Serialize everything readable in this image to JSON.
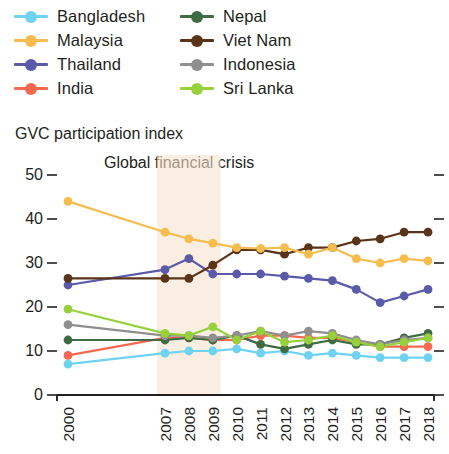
{
  "legend": {
    "columns": [
      [
        {
          "label": "Bangladesh",
          "color": "#6ed3f0",
          "name": "legend-item-bangladesh"
        },
        {
          "label": "Malaysia",
          "color": "#f5bd4e",
          "name": "legend-item-malaysia"
        },
        {
          "label": "Thailand",
          "color": "#5b5aa8",
          "name": "legend-item-thailand"
        },
        {
          "label": "India",
          "color": "#f4694f",
          "name": "legend-item-india"
        }
      ],
      [
        {
          "label": "Nepal",
          "color": "#3f6b42",
          "name": "legend-item-nepal"
        },
        {
          "label": "Viet Nam",
          "color": "#5a3418",
          "name": "legend-item-viet-nam"
        },
        {
          "label": "Indonesia",
          "color": "#8f8f8f",
          "name": "legend-item-indonesia"
        },
        {
          "label": "Sri Lanka",
          "color": "#96d13c",
          "name": "legend-item-sri-lanka"
        }
      ]
    ]
  },
  "chart_data": {
    "type": "line",
    "title": "GVC participation index",
    "xlabel": "",
    "ylabel": "GVC participation index",
    "ylim": [
      0,
      50
    ],
    "yticks": [
      0,
      10,
      20,
      30,
      40,
      50
    ],
    "grid": false,
    "legend_position": "top",
    "x": [
      "2000",
      "2007",
      "2008",
      "2009",
      "2010",
      "2011",
      "2012",
      "2013",
      "2014",
      "2015",
      "2016",
      "2017",
      "2018"
    ],
    "categories": [
      "2000",
      "2007",
      "2008",
      "2009",
      "2010",
      "2011",
      "2012",
      "2013",
      "2014",
      "2015",
      "2016",
      "2017",
      "2018"
    ],
    "annotations": [
      {
        "text": "Global financial crisis",
        "type": "band-label",
        "band_start": "2007",
        "band_end": "2009",
        "band_color": "#f6e3cf"
      }
    ],
    "series": [
      {
        "name": "Malaysia",
        "color": "#f5bd4e",
        "values": [
          44.0,
          37.0,
          35.5,
          34.5,
          33.5,
          33.3,
          33.5,
          32.0,
          33.5,
          31.0,
          30.0,
          31.0,
          30.5
        ]
      },
      {
        "name": "Viet Nam",
        "color": "#5a3418",
        "values": [
          26.5,
          26.5,
          26.5,
          29.5,
          33.0,
          33.0,
          32.0,
          33.5,
          33.5,
          35.0,
          35.5,
          37.0,
          37.0
        ]
      },
      {
        "name": "Thailand",
        "color": "#5b5aa8",
        "values": [
          25.0,
          28.5,
          31.0,
          27.5,
          27.5,
          27.5,
          27.0,
          26.5,
          26.0,
          24.0,
          21.0,
          22.5,
          24.0
        ]
      },
      {
        "name": "Sri Lanka",
        "color": "#96d13c",
        "values": [
          19.5,
          14.0,
          13.5,
          15.5,
          12.5,
          14.5,
          12.0,
          12.5,
          13.5,
          12.0,
          11.0,
          12.0,
          13.0
        ]
      },
      {
        "name": "Indonesia",
        "color": "#8f8f8f",
        "values": [
          16.0,
          13.5,
          13.5,
          13.0,
          13.5,
          14.5,
          13.5,
          14.5,
          14.0,
          12.5,
          11.5,
          12.5,
          13.0
        ]
      },
      {
        "name": "Nepal",
        "color": "#3f6b42",
        "values": [
          12.5,
          12.5,
          13.0,
          12.5,
          13.5,
          11.5,
          10.5,
          11.5,
          12.5,
          11.5,
          11.5,
          13.0,
          14.0
        ]
      },
      {
        "name": "India",
        "color": "#f4694f",
        "values": [
          9.0,
          13.0,
          13.0,
          12.5,
          12.5,
          13.5,
          13.5,
          13.0,
          13.0,
          12.0,
          11.0,
          11.0,
          11.0
        ]
      },
      {
        "name": "Bangladesh",
        "color": "#6ed3f0",
        "values": [
          7.0,
          9.5,
          10.0,
          10.0,
          10.5,
          9.5,
          10.0,
          9.0,
          9.5,
          9.0,
          8.5,
          8.5,
          8.5
        ]
      }
    ]
  }
}
